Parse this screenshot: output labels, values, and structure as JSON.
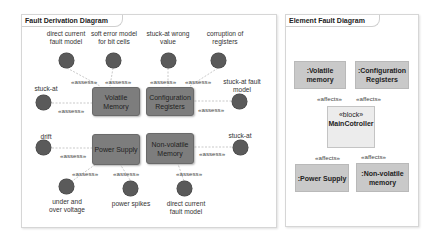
{
  "fault_derivation": {
    "title": "Fault Derivation Diagram",
    "blocks": {
      "volatile_memory": "Volatile\nMemory",
      "configuration_registers": "Configuration\nRegisters",
      "power_supply": "Power Supply",
      "non_volatile_memory": "Non-volatile\nMemory"
    },
    "faults": [
      {
        "id": "f1",
        "label": "direct current\nfault model",
        "target": "Volatile Memory"
      },
      {
        "id": "f2",
        "label": "soft error model\nfor bit cells",
        "target": "Volatile Memory"
      },
      {
        "id": "f3",
        "label": "stuck-at wrong\nvalue",
        "target": "Configuration Registers"
      },
      {
        "id": "f4",
        "label": "corruption of\nregisters",
        "target": "Configuration Registers"
      },
      {
        "id": "f5",
        "label": "stuck-at",
        "target": "Volatile Memory"
      },
      {
        "id": "f6",
        "label": "stuck-at fault\nmodel",
        "target": "Configuration Registers"
      },
      {
        "id": "f7",
        "label": "drift",
        "target": "Power Supply"
      },
      {
        "id": "f8",
        "label": "stuck-at",
        "target": "Non-volatile Memory"
      },
      {
        "id": "f9",
        "label": "under and\nover voltage",
        "target": "Power Supply"
      },
      {
        "id": "f10",
        "label": "power spikes",
        "target": "Power Supply"
      },
      {
        "id": "f11",
        "label": "direct current\nfault model",
        "target": "Non-volatile Memory"
      }
    ],
    "relation_label": "«assess»"
  },
  "element_fault": {
    "title": "Element Fault Diagram",
    "parts": {
      "volatile_memory": ":Volatile\nmemory",
      "configuration_registers": ":Configuration\nRegisters",
      "power_supply": ":Power Supply",
      "non_volatile_memory": ":Non-volatile\nmemory"
    },
    "main_block": {
      "stereotype": "«block»",
      "name": "MainCotroller"
    },
    "relation_label": "«affects»"
  }
}
